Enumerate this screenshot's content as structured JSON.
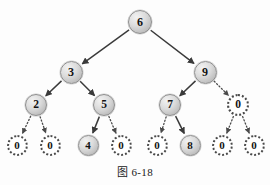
{
  "figure": {
    "caption": "图 6-18",
    "type": "binary-search-tree-diagram",
    "colors": {
      "node_fill": "#cfcfcf",
      "node_stroke": "#8d8d8d",
      "nil_fill": "#ffffff",
      "nil_stroke": "#4a4a4a",
      "edge": "#3a3a3a",
      "text": "#141414",
      "background": "#fdfdfd"
    },
    "nodes": [
      {
        "id": "n6",
        "label": "6",
        "kind": "filled",
        "level": 0,
        "cx": 140,
        "cy": 22
      },
      {
        "id": "n3",
        "label": "3",
        "kind": "filled",
        "level": 1,
        "cx": 71,
        "cy": 72
      },
      {
        "id": "n9",
        "label": "9",
        "kind": "filled",
        "level": 1,
        "cx": 205,
        "cy": 72
      },
      {
        "id": "n2",
        "label": "2",
        "kind": "filled",
        "level": 2,
        "cx": 36,
        "cy": 105
      },
      {
        "id": "n5",
        "label": "5",
        "kind": "filled",
        "level": 2,
        "cx": 104,
        "cy": 105
      },
      {
        "id": "n7",
        "label": "7",
        "kind": "filled",
        "level": 2,
        "cx": 170,
        "cy": 105
      },
      {
        "id": "n9r",
        "label": "0",
        "kind": "nil",
        "level": 2,
        "cx": 238,
        "cy": 105
      },
      {
        "id": "n2l",
        "label": "0",
        "kind": "nil",
        "level": 3,
        "cx": 17,
        "cy": 145
      },
      {
        "id": "n2r",
        "label": "0",
        "kind": "nil",
        "level": 3,
        "cx": 50,
        "cy": 145
      },
      {
        "id": "n4",
        "label": "4",
        "kind": "filled",
        "level": 3,
        "cx": 88,
        "cy": 145
      },
      {
        "id": "n5r",
        "label": "0",
        "kind": "nil",
        "level": 3,
        "cx": 121,
        "cy": 145
      },
      {
        "id": "n7l",
        "label": "0",
        "kind": "nil",
        "level": 3,
        "cx": 157,
        "cy": 145
      },
      {
        "id": "n8",
        "label": "8",
        "kind": "filled",
        "level": 3,
        "cx": 190,
        "cy": 145
      },
      {
        "id": "n0l",
        "label": "0",
        "kind": "nil",
        "level": 3,
        "cx": 222,
        "cy": 145
      },
      {
        "id": "n0r",
        "label": "0",
        "kind": "nil",
        "level": 3,
        "cx": 254,
        "cy": 145
      }
    ],
    "edges": [
      {
        "from": "n6",
        "to": "n3",
        "style": "solid"
      },
      {
        "from": "n6",
        "to": "n9",
        "style": "solid"
      },
      {
        "from": "n3",
        "to": "n2",
        "style": "solid"
      },
      {
        "from": "n3",
        "to": "n5",
        "style": "solid"
      },
      {
        "from": "n9",
        "to": "n7",
        "style": "solid"
      },
      {
        "from": "n9",
        "to": "n9r",
        "style": "dotted"
      },
      {
        "from": "n2",
        "to": "n2l",
        "style": "dotted"
      },
      {
        "from": "n2",
        "to": "n2r",
        "style": "dotted"
      },
      {
        "from": "n5",
        "to": "n4",
        "style": "solid"
      },
      {
        "from": "n5",
        "to": "n5r",
        "style": "dotted"
      },
      {
        "from": "n7",
        "to": "n7l",
        "style": "dotted"
      },
      {
        "from": "n7",
        "to": "n8",
        "style": "solid"
      },
      {
        "from": "n9r",
        "to": "n0l",
        "style": "dotted"
      },
      {
        "from": "n9r",
        "to": "n0r",
        "style": "dotted"
      }
    ]
  }
}
